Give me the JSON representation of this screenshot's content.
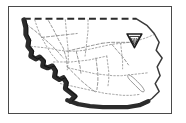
{
  "figure": {
    "kind": "locator-map",
    "title": "Regional locator map",
    "description": "Black and white line-art outline map of a coastal region with a shaded coastline, a dashed northern boundary, dotted interior boundary and road lines, an inland lake, and a single triangular shield site marker in the northeast interior.",
    "caption": ""
  },
  "frame": {
    "visible": true,
    "border_color": "#4a4a4a",
    "background_color": "#ffffff",
    "x": 8,
    "y": 6,
    "width": 164,
    "height": 108
  },
  "colors": {
    "coastline_shade": "#2b2b2b",
    "outline": "#3a3a3a",
    "interior_line": "#8c8c8c",
    "dashed_border": "#2b2b2b",
    "marker_fill": "#ffffff",
    "marker_stroke": "#1a1a1a",
    "paper": "#ffffff"
  },
  "map_features": {
    "coastline": {
      "name": "coastline",
      "label": "Pacific coastline",
      "style": "thick-shaded",
      "stroke_width": 5
    },
    "northern_boundary": {
      "name": "northern-boundary",
      "label": "Northern state line",
      "style": "dashed",
      "dash_pattern": "7 4",
      "stroke_width": 2
    },
    "eastern_boundary": {
      "name": "eastern-boundary",
      "label": "Eastern boundary",
      "style": "solid",
      "stroke_width": 1.4
    },
    "interior_boundaries": {
      "name": "interior-boundaries",
      "label": "County boundaries",
      "style": "dotted",
      "dash_pattern": "1.5 2",
      "stroke_width": 0.9
    },
    "roads": {
      "name": "roads",
      "label": "Highways",
      "style": "dashed-thin",
      "dash_pattern": "3 2",
      "stroke_width": 0.9
    },
    "lake": {
      "name": "inland-lake",
      "label": "Inland lake",
      "style": "outline",
      "stroke_width": 0.9
    }
  },
  "markers": [
    {
      "id": "site-1",
      "name": "site-marker",
      "shape": "inverted-triangle-shield",
      "label": "",
      "x": 127,
      "y": 34,
      "size": 14,
      "fill": "#ffffff",
      "stroke": "#1a1a1a"
    }
  ],
  "legend": {
    "visible": false,
    "items": []
  },
  "scale_bar": {
    "visible": false,
    "label": ""
  },
  "north_arrow": {
    "visible": false,
    "label": ""
  }
}
